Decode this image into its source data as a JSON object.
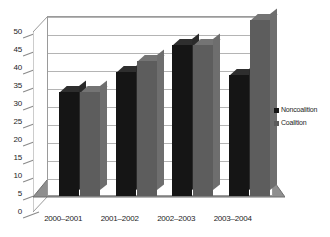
{
  "chart_data": {
    "type": "bar",
    "title": "",
    "subtitle": "",
    "xlabel": "",
    "ylabel": "",
    "categories": [
      "2000–2001",
      "2001–2002",
      "2002–2003",
      "2003–2004"
    ],
    "series": [
      {
        "name": "Noncoalition",
        "color": "#151515",
        "values": [
          29,
          34.5,
          42,
          33.5
        ]
      },
      {
        "name": "Coalition",
        "color": "#5d5d5d",
        "values": [
          29,
          37.5,
          42,
          49
        ]
      }
    ],
    "ylim": [
      0,
      50
    ],
    "ytick_step": 5,
    "yticks": [
      0,
      5,
      10,
      15,
      20,
      25,
      30,
      35,
      40,
      45,
      50
    ],
    "ytick_labels": [
      "0",
      "5",
      "10",
      "15",
      "20",
      "25",
      "30",
      "35",
      "40",
      "45",
      "50"
    ],
    "grid": true,
    "grid_axis": "y",
    "legend_position": "right",
    "style_3d": true,
    "plot_background": "#ffffff",
    "grid_color": "#b4b4b4",
    "axis_color": "#9a9a9a",
    "floor_color": "#8f8f8f"
  },
  "legend": {
    "entries": [
      {
        "label": "Noncoalition",
        "color": "#151515"
      },
      {
        "label": "Coalition",
        "color": "#5d5d5d"
      }
    ]
  }
}
